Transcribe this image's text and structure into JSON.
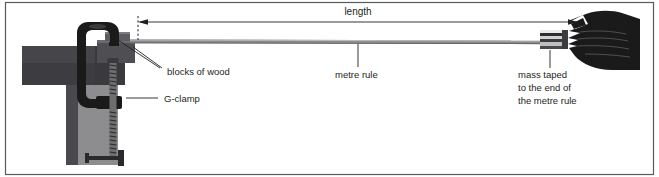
{
  "figure": {
    "name": "metre-rule-oscillation-apparatus",
    "width": 659,
    "height": 177,
    "background_color": "#ffffff",
    "border_color": "#58595b"
  },
  "labels": {
    "length": "length",
    "blocks_of_wood": "blocks of wood",
    "metre_rule": "metre rule",
    "g_clamp": "G-clamp",
    "mass_line_1": "mass taped",
    "mass_line_2": "to the end of",
    "mass_line_3": "the metre rule"
  },
  "colors": {
    "bench_top_dark": "#3f3f41",
    "bench_front_mid": "#58585a",
    "bench_leg_light": "#8d8d8f",
    "clamp_black": "#1a1a1a",
    "wood_block_dark": "#4a4a4c",
    "wood_block_light": "#6e6e70",
    "rule_gray": "#7e7e80",
    "mass_light": "#d9d9d9",
    "mass_dark": "#2e2e30",
    "hand_black": "#1a1a1a",
    "leader_line": "#58595b",
    "text": "#231f20"
  },
  "annotations": {
    "length_arrow": {
      "x_start": 138,
      "x_end": 578,
      "y": 22,
      "double_headed": true
    },
    "rule_line": {
      "x_start": 133,
      "x_end": 560,
      "y": 42
    }
  }
}
